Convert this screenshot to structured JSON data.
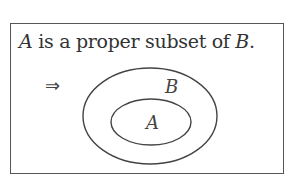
{
  "statement": {
    "subject": "A",
    "middle": " is a proper subset of ",
    "object": "B",
    "end": "."
  },
  "implies_symbol": "⇒",
  "diagram": {
    "type": "venn-subset",
    "outer_set": {
      "label": "B",
      "cx": 150,
      "cy": 116,
      "rx": 67,
      "ry": 48
    },
    "inner_set": {
      "label": "A",
      "cx": 151,
      "cy": 122,
      "rx": 40,
      "ry": 23
    },
    "stroke_color": "#444444"
  }
}
